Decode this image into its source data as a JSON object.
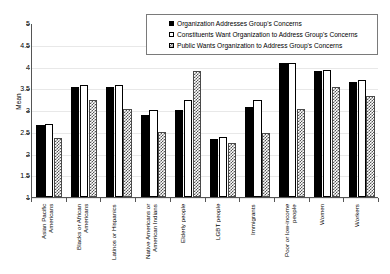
{
  "chart_data": {
    "type": "bar",
    "title": "",
    "xlabel": "",
    "ylabel": "Mean",
    "ylim": [
      1,
      5
    ],
    "ytick_step": 0.5,
    "yticks": [
      "5",
      "4.5",
      "4",
      "3.5",
      "3",
      "2.5",
      "2",
      "1.5",
      "1"
    ],
    "grid": true,
    "legend_position": "top-right",
    "categories": [
      "Asian Pacific\nAmericans",
      "Blacks or African\nAmericans",
      "Latinos or Hispanics",
      "Native Americans or\nAmerican Indians",
      "Elderly people",
      "LGBT people",
      "Immigrants",
      "Poor or low-income\npeople",
      "Women",
      "Workers"
    ],
    "series": [
      {
        "name": "Organization Addresses Group's Concerns",
        "style": "solid-black",
        "values": [
          2.66,
          3.53,
          3.54,
          2.89,
          3.0,
          2.33,
          3.08,
          4.08,
          3.89,
          3.65
        ]
      },
      {
        "name": "Constituents Want Organization to Address Group's Concerns",
        "style": "hollow-white",
        "values": [
          2.68,
          3.57,
          3.57,
          2.99,
          3.22,
          2.37,
          3.23,
          4.09,
          3.92,
          3.69
        ]
      },
      {
        "name": "Public Wants Organization to Address Group's Concerns",
        "style": "checkered-gray",
        "values": [
          2.35,
          3.24,
          3.02,
          2.49,
          3.89,
          2.24,
          2.47,
          3.02,
          3.52,
          3.32
        ]
      }
    ]
  },
  "colors": {
    "series_1": "#000000",
    "series_2": "#ffffff",
    "series_3": "#555555",
    "axis": "#555555",
    "grid": "#e8e8e8",
    "legend_border": "#7a7a7a"
  }
}
